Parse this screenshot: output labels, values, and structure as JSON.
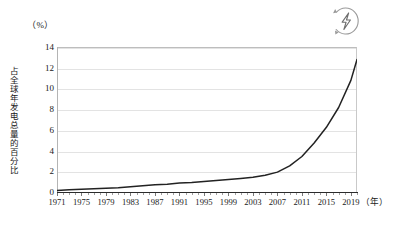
{
  "figure": {
    "unit_label": "（%）",
    "y_axis_title": "占全球年发电总量的百分比",
    "x_axis_unit": "（年）",
    "icon_name": "renewable-energy-bolt-icon",
    "line_color": "#222222",
    "grid_color": "#e3e3e3",
    "axis_color": "#2b2b2b"
  },
  "chart_data": {
    "type": "line",
    "title": "",
    "xlabel": "（年）",
    "ylabel": "占全球年发电总量的百分比（%）",
    "xlim": [
      1971,
      2020
    ],
    "ylim": [
      0,
      14
    ],
    "ytick_labels": [
      "0",
      "2",
      "4",
      "6",
      "8",
      "10",
      "12",
      "14"
    ],
    "yticks": [
      0,
      2,
      4,
      6,
      8,
      10,
      12,
      14
    ],
    "xtick_labels": [
      "1971",
      "1975",
      "1979",
      "1983",
      "1987",
      "1991",
      "1995",
      "1999",
      "2003",
      "2007",
      "2011",
      "2015",
      "2019"
    ],
    "xticks": [
      1971,
      1975,
      1979,
      1983,
      1987,
      1991,
      1995,
      1999,
      2003,
      2007,
      2011,
      2015,
      2019
    ],
    "grid": "horizontal",
    "legend": "none",
    "series": [
      {
        "name": "占全球年发电总量的百分比",
        "color": "#222222",
        "x": [
          1971,
          1973,
          1975,
          1977,
          1979,
          1981,
          1983,
          1985,
          1987,
          1989,
          1991,
          1993,
          1995,
          1997,
          1999,
          2001,
          2003,
          2005,
          2007,
          2009,
          2011,
          2013,
          2015,
          2017,
          2019,
          2020
        ],
        "values": [
          0.25,
          0.3,
          0.35,
          0.4,
          0.45,
          0.5,
          0.6,
          0.7,
          0.8,
          0.85,
          0.95,
          1.0,
          1.1,
          1.2,
          1.3,
          1.4,
          1.5,
          1.7,
          2.0,
          2.6,
          3.5,
          4.8,
          6.3,
          8.2,
          10.8,
          12.8
        ]
      }
    ]
  }
}
